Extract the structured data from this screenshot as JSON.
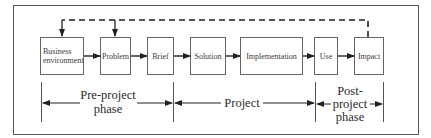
{
  "diagram": {
    "type": "process-flow",
    "colors": {
      "background": "#ffffff",
      "stroke": "#444444",
      "text": "#3a3a3a"
    },
    "stages": [
      {
        "id": "business-environment",
        "lines": [
          "Business",
          "environment"
        ]
      },
      {
        "id": "problem",
        "lines": [
          "Problem"
        ]
      },
      {
        "id": "brief",
        "lines": [
          "Brief"
        ]
      },
      {
        "id": "solution",
        "lines": [
          "Solution"
        ]
      },
      {
        "id": "implementation",
        "lines": [
          "Implementation"
        ]
      },
      {
        "id": "use",
        "lines": [
          "Use"
        ]
      },
      {
        "id": "impact",
        "lines": [
          "Impact"
        ]
      }
    ],
    "flow": [
      [
        "business-environment",
        "problem"
      ],
      [
        "problem",
        "brief"
      ],
      [
        "brief",
        "solution"
      ],
      [
        "solution",
        "implementation"
      ],
      [
        "implementation",
        "use"
      ],
      [
        "use",
        "impact"
      ]
    ],
    "feedback": {
      "style": "dashed",
      "from": "impact",
      "to": [
        "business-environment",
        "problem"
      ]
    },
    "phases": [
      {
        "id": "pre-project",
        "lines": [
          "Pre-project",
          "phase"
        ]
      },
      {
        "id": "project",
        "lines": [
          "Project"
        ]
      },
      {
        "id": "post-project",
        "lines": [
          "Post-",
          "project",
          "phase"
        ]
      }
    ]
  }
}
